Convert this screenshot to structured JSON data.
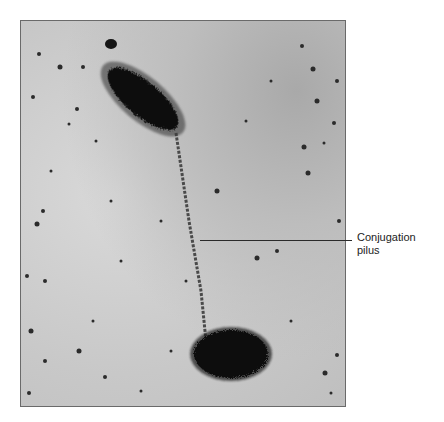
{
  "figure": {
    "type": "electron micrograph",
    "colors": {
      "background": "#ffffff",
      "specimen_bg": "#c8c8c8",
      "cells": "#111111",
      "frame": "#6a6a6a"
    }
  },
  "annotations": [
    {
      "text_line1": "Conjugation",
      "text_line2": "pilus",
      "points_to": "pilus"
    }
  ]
}
